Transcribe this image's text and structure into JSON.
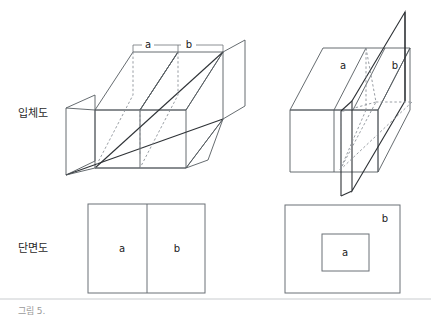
{
  "figure": {
    "caption": "그림 5.",
    "rows": [
      {
        "key": "isometric",
        "label": "입체도"
      },
      {
        "key": "section",
        "label": "단면도"
      }
    ],
    "panels": {
      "top_left": {
        "name": "isometric-parallel-planes",
        "labels": {
          "a": "a",
          "b": "b"
        },
        "dimension_labels": [
          "a",
          "b"
        ]
      },
      "top_right": {
        "name": "isometric-intersecting-plane",
        "labels": {
          "a": "a",
          "b": "b"
        }
      },
      "bottom_left": {
        "name": "section-split-rectangle",
        "labels": {
          "a": "a",
          "b": "b"
        }
      },
      "bottom_right": {
        "name": "section-nested-rectangle",
        "labels": {
          "a": "a",
          "b": "b"
        }
      }
    },
    "colors": {
      "line": "#555b60",
      "line_dark": "#2e3236",
      "dashed": "#8c9298",
      "text": "#2a2a2a",
      "caption": "#9a9a9a",
      "background": "#ffffff"
    }
  }
}
